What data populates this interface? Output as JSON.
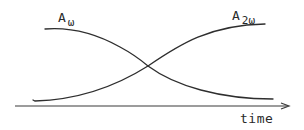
{
  "diagram": {
    "axis": {
      "label": "time",
      "color": "#3a3a3a"
    },
    "curves": [
      {
        "name": "A_omega",
        "label_main": "A",
        "label_sub": "ω",
        "trend": "decreasing",
        "color": "#2e2e2e"
      },
      {
        "name": "A_2omega",
        "label_main": "A",
        "label_sub": "2ω",
        "trend": "increasing",
        "color": "#2e2e2e"
      }
    ],
    "crossing_point": "mid"
  }
}
